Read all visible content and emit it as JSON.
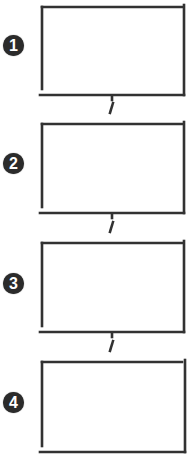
{
  "diagram": {
    "type": "vertical-flow",
    "steps": [
      {
        "number": "1",
        "label": ""
      },
      {
        "number": "2",
        "label": ""
      },
      {
        "number": "3",
        "label": ""
      },
      {
        "number": "4",
        "label": ""
      }
    ],
    "colors": {
      "line": "#333333",
      "badge": "#2b2b2b",
      "background": "#ffffff"
    }
  }
}
